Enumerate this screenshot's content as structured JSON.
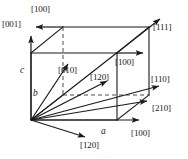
{
  "figure": {
    "colors": {
      "line": "#1a1a1a",
      "dashed": "#4d4d4d",
      "background": "#ffffff",
      "text": "#1a1a1a"
    },
    "axis_labels": [
      {
        "id": "axis-a",
        "text": "a",
        "x": 101,
        "y": 128,
        "italic": true
      },
      {
        "id": "axis-b",
        "text": "b",
        "x": 33,
        "y": 89,
        "italic": true
      },
      {
        "id": "axis-c",
        "text": "c",
        "x": 20,
        "y": 66,
        "italic": true
      }
    ],
    "direction_labels": [
      {
        "id": "dir-100-top",
        "text": "[100]",
        "x": 31,
        "y": 4
      },
      {
        "id": "dir-001",
        "text": "[001]",
        "x": 2,
        "y": 19
      },
      {
        "id": "dir-111",
        "text": "[111]",
        "x": 153,
        "y": 22
      },
      {
        "id": "dir-100-mid",
        "text": "[100]",
        "x": 115,
        "y": 57
      },
      {
        "id": "dir-010",
        "text": "[010]",
        "x": 58,
        "y": 65
      },
      {
        "id": "dir-120-mid",
        "text": "[120]",
        "x": 90,
        "y": 72
      },
      {
        "id": "dir-110",
        "text": "[110]",
        "x": 151,
        "y": 74
      },
      {
        "id": "dir-210",
        "text": "[210]",
        "x": 152,
        "y": 103
      },
      {
        "id": "dir-100-bottom",
        "text": "[100]",
        "x": 131,
        "y": 128
      },
      {
        "id": "dir-120-bottom",
        "text": "[120]",
        "x": 80,
        "y": 140
      }
    ],
    "geometry": {
      "cube": {
        "front_bottom_left": [
          31,
          120
        ],
        "front_bottom_right": [
          117,
          120
        ],
        "front_top_left": [
          31,
          53
        ],
        "front_top_right": [
          117,
          53
        ],
        "back_bottom_left": [
          63,
          95
        ],
        "back_bottom_right": [
          149,
          95
        ],
        "back_top_left": [
          63,
          27
        ],
        "back_top_right": [
          149,
          27
        ]
      },
      "vectors": [
        {
          "name": "[001]",
          "from": [
            31,
            120
          ],
          "to": [
            31,
            34
          ]
        },
        {
          "name": "[100]-top",
          "from": [
            63,
            27
          ],
          "to": [
            33,
            27
          ]
        },
        {
          "name": "[111]",
          "from": [
            31,
            120
          ],
          "to": [
            162,
            17
          ]
        },
        {
          "name": "[100]-mid",
          "from": [
            117,
            53
          ],
          "to": [
            147,
            53
          ]
        },
        {
          "name": "[010]",
          "from": [
            31,
            120
          ],
          "to": [
            70,
            62
          ]
        },
        {
          "name": "[120]-mid",
          "from": [
            31,
            120
          ],
          "to": [
            110,
            79
          ]
        },
        {
          "name": "[110]",
          "from": [
            31,
            120
          ],
          "to": [
            162,
            85
          ]
        },
        {
          "name": "[210]",
          "from": [
            31,
            120
          ],
          "to": [
            150,
            100
          ]
        },
        {
          "name": "[100]-bottom",
          "from": [
            31,
            120
          ],
          "to": [
            143,
            120
          ]
        },
        {
          "name": "[120]-bottom",
          "from": [
            31,
            120
          ],
          "to": [
            88,
            138
          ]
        }
      ],
      "dashed_edges": [
        {
          "from": [
            63,
            27
          ],
          "to": [
            63,
            95
          ]
        },
        {
          "from": [
            63,
            95
          ],
          "to": [
            149,
            95
          ]
        }
      ]
    }
  }
}
